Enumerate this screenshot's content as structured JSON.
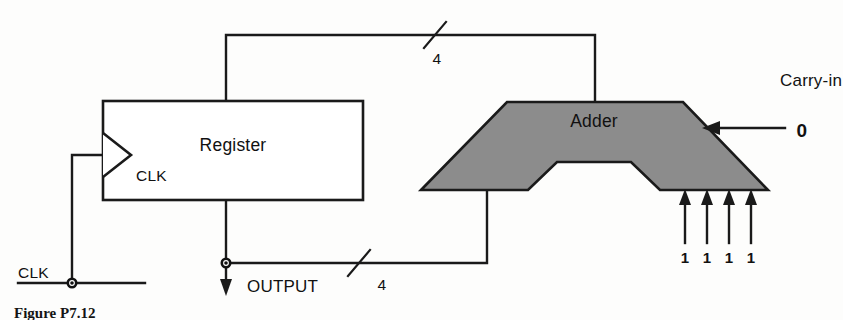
{
  "figure": {
    "type": "digital-logic-block-diagram",
    "caption": "Figure P7.12",
    "background_color": "#fdfdfc",
    "line_color": "#1a1a1a",
    "adder_fill_color": "#8c8c8c"
  },
  "blocks": {
    "register": {
      "label": "Register",
      "clock_label": "CLK",
      "shape": "rectangle"
    },
    "adder": {
      "label": "Adder",
      "shape": "alu-trapezoid-notched"
    }
  },
  "signals": {
    "clock_input": "CLK",
    "output": "OUTPUT",
    "carry_in_label": "Carry-in",
    "carry_in_value": "0",
    "feedback_bus_width": "4",
    "output_bus_width": "4",
    "adder_data_inputs": [
      "1",
      "1",
      "1",
      "1"
    ]
  },
  "icons": {
    "clock_triangle": "clock-triangle-icon",
    "bus_slash_top": "bus-width-slash-icon",
    "bus_slash_bottom": "bus-width-slash-icon",
    "output_arrow": "down-arrow-icon",
    "carry_arrow": "left-arrow-icon",
    "input_arrows": "up-arrow-icon",
    "junction_clk": "junction-dot-icon",
    "junction_output": "junction-dot-icon"
  }
}
